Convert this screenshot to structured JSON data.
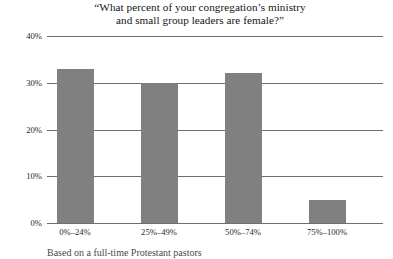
{
  "chart_data": {
    "type": "bar",
    "title": "“What percent of your congregation’s ministry and small group leaders are female?”",
    "title_lines": [
      "“What percent of your congregation’s ministry",
      "and small group leaders are female?”"
    ],
    "categories": [
      "0%–24%",
      "25%–49%",
      "50%–74%",
      "75%–100%"
    ],
    "values": [
      33,
      30,
      32,
      5
    ],
    "xlabel": "",
    "ylabel": "",
    "ylim": [
      0,
      40
    ],
    "ytick_values": [
      0,
      10,
      20,
      30,
      40
    ],
    "ytick_labels": [
      "0%",
      "10%",
      "20%",
      "30%",
      "40%"
    ],
    "grid": true,
    "legend": false,
    "bar_color": "#808080",
    "gridline_color": "#6e6e6e",
    "background_color": "#ffffff"
  },
  "caption": {
    "text": "Based on a full-time Protestant pastors"
  }
}
